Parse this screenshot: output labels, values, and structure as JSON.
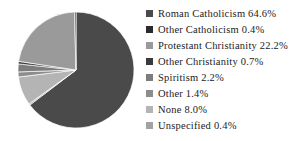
{
  "chart_data": {
    "type": "pie",
    "title": "",
    "legend_position": "right",
    "grid": false,
    "units": "percent",
    "start_angle_deg": 0,
    "direction": "clockwise",
    "categories": [
      "Roman Catholicism",
      "Other Catholicism",
      "Protestant Christianity",
      "Other Christianity",
      "Spiritism",
      "Other",
      "None",
      "Unspecified"
    ],
    "values": [
      64.6,
      0.4,
      22.2,
      0.7,
      2.2,
      1.4,
      8.0,
      0.4
    ],
    "colors": [
      "#4a4a4a",
      "#2b2b2b",
      "#9a9a9a",
      "#3a3a3a",
      "#7d7d7d",
      "#8c8c8c",
      "#b4b4b4",
      "#a2a2a2"
    ],
    "slice_order_clockwise_from_top": [
      "Roman Catholicism",
      "Unspecified",
      "None",
      "Other",
      "Spiritism",
      "Other Christianity",
      "Protestant Christianity",
      "Other Catholicism"
    ]
  },
  "legend": {
    "items": [
      {
        "label": "Roman Catholicism 64.6%",
        "color": "#4a4a4a",
        "swatch_name": "legend-swatch-roman-catholicism"
      },
      {
        "label": "Other Catholicism 0.4%",
        "color": "#2b2b2b",
        "swatch_name": "legend-swatch-other-catholicism"
      },
      {
        "label": "Protestant Christianity  22.2%",
        "color": "#9a9a9a",
        "swatch_name": "legend-swatch-protestant-christianity"
      },
      {
        "label": "Other Christianity 0.7%",
        "color": "#3a3a3a",
        "swatch_name": "legend-swatch-other-christianity"
      },
      {
        "label": "Spiritism 2.2%",
        "color": "#7d7d7d",
        "swatch_name": "legend-swatch-spiritism"
      },
      {
        "label": "Other 1.4%",
        "color": "#8c8c8c",
        "swatch_name": "legend-swatch-other"
      },
      {
        "label": "None 8.0%",
        "color": "#b4b4b4",
        "swatch_name": "legend-swatch-none"
      },
      {
        "label": "Unspecified 0.4%",
        "color": "#a2a2a2",
        "swatch_name": "legend-swatch-unspecified"
      }
    ]
  }
}
